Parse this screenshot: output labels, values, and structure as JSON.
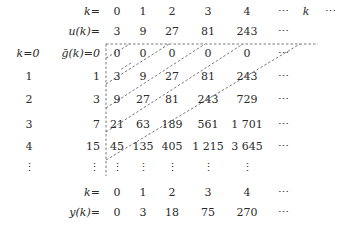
{
  "header": {
    "k_label": "k=",
    "k_values": [
      "0",
      "1",
      "2",
      "3",
      "4",
      "⋯",
      "k",
      "⋯"
    ],
    "u_label": "u(k)=",
    "u_values": [
      "3",
      "9",
      "27",
      "81",
      "243",
      "⋯"
    ]
  },
  "left_index": {
    "labels": [
      "k=0",
      "1",
      "2",
      "3",
      "4",
      "⋮"
    ]
  },
  "g_column": {
    "label": "ḡ(k)=0",
    "values": [
      "1",
      "3",
      "7",
      "15",
      "⋮"
    ]
  },
  "grid": {
    "rows": [
      [
        "0",
        "0",
        "0",
        "0",
        "0",
        "⋯"
      ],
      [
        "3",
        "9",
        "27",
        "81",
        "243",
        "⋯"
      ],
      [
        "9",
        "27",
        "81",
        "243",
        "729",
        "⋯"
      ],
      [
        "21",
        "63",
        "189",
        "561",
        "1 701",
        "⋯"
      ],
      [
        "45",
        "135",
        "405",
        "1 215",
        "3 645",
        "⋯"
      ],
      [
        "⋮",
        "⋮",
        "⋮",
        "⋮",
        "⋮",
        ""
      ]
    ]
  },
  "footer": {
    "k_label": "k=",
    "k_values": [
      "0",
      "1",
      "2",
      "3",
      "4",
      "⋯"
    ],
    "y_label": "y(k)=",
    "y_values": [
      "0",
      "3",
      "18",
      "75",
      "270",
      "⋯"
    ]
  },
  "colors": {
    "text": "#2a2a2a",
    "dash_line": "#555555"
  }
}
